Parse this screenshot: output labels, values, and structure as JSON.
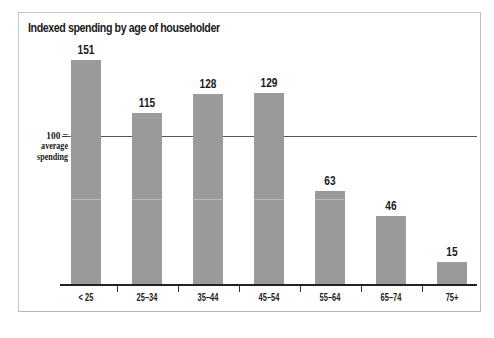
{
  "chart_data": {
    "type": "bar",
    "title": "Indexed spending by age of householder",
    "categories": [
      "< 25",
      "25–34",
      "35–44",
      "45–54",
      "55–64",
      "65–74",
      "75+"
    ],
    "values": [
      151,
      115,
      128,
      129,
      63,
      46,
      15
    ],
    "xlabel": "",
    "ylabel": "",
    "ylim": [
      0,
      151
    ],
    "grid": false,
    "legend": null,
    "reference_line": {
      "value": 100,
      "label_line1": "100 =",
      "label_line2": "average",
      "label_line3": "spending"
    },
    "bar_color": "#9a9a9a",
    "data_labels": [
      "151",
      "115",
      "128",
      "129",
      "63",
      "46",
      "15"
    ]
  },
  "layout": {
    "baseline_y": 284,
    "px_per_unit": 1.483,
    "bar_x": [
      71,
      132,
      193,
      254,
      315,
      376,
      437
    ],
    "tick_x": [
      117,
      178,
      239,
      300,
      361,
      422
    ]
  }
}
